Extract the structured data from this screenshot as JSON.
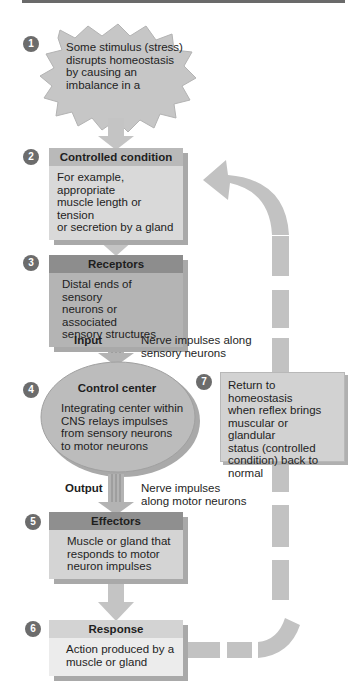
{
  "colors": {
    "badge": "#6c6c6c",
    "arrow": "#c4c4c4",
    "feedback_loop": "#c2c2c2",
    "controlled_condition_header": "#b9b9b9",
    "controlled_condition_body": "#d9d9d9",
    "receptors_header": "#8d8d8d",
    "receptors_body": "#b4b4b4",
    "control_center": "#b8b8b8",
    "effectors_header": "#8f8f8f",
    "effectors_body": "#d4d4d4",
    "response_header": "#d3d3d3",
    "response_body": "#ececec",
    "return_box": "#d2d2d2"
  },
  "steps": {
    "s1": {
      "number": "1",
      "text_lines": [
        "Some stimulus (stress)",
        "disrupts homeostasis",
        "by causing an",
        "imbalance in a"
      ]
    },
    "s2": {
      "number": "2",
      "title": "Controlled condition",
      "text_lines": [
        "For example, appropriate",
        "muscle length or tension",
        "or secretion by a gland"
      ]
    },
    "s3": {
      "number": "3",
      "title": "Receptors",
      "text_lines": [
        "Distal ends of sensory",
        "neurons or associated",
        "sensory structures"
      ]
    },
    "s4": {
      "number": "4",
      "title": "Control center",
      "text_lines": [
        "Integrating center within",
        "CNS relays impulses",
        "from sensory neurons",
        "to motor neurons"
      ]
    },
    "s5": {
      "number": "5",
      "title": "Effectors",
      "text_lines": [
        "Muscle or gland that",
        "responds to motor",
        "neuron impulses"
      ]
    },
    "s6": {
      "number": "6",
      "title": "Response",
      "text_lines": [
        "Action produced by a",
        "muscle or gland"
      ]
    },
    "s7": {
      "number": "7",
      "text_lines": [
        "Return to homeostasis",
        "when reflex brings",
        "muscular or glandular",
        "status (controlled",
        "condition) back to",
        "normal"
      ]
    }
  },
  "connectors": {
    "input": {
      "label": "Input",
      "desc_lines": [
        "Nerve impulses along",
        "sensory neurons"
      ]
    },
    "output": {
      "label": "Output",
      "desc_lines": [
        "Nerve impulses",
        "along motor neurons"
      ]
    }
  }
}
